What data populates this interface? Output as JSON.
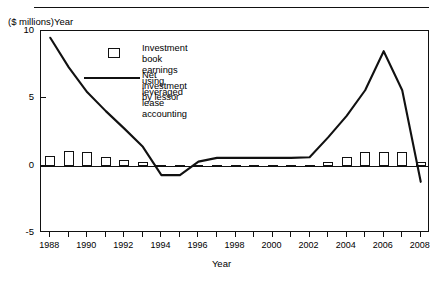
{
  "figure": {
    "y_axis_caption": "($ millions)Year",
    "x_title": "Year"
  },
  "legend": {
    "position": "inside-top-center",
    "items": [
      {
        "marker": "open-square",
        "label": "Investment book earnings using\nleveraged lease accounting"
      },
      {
        "marker": "solid-line",
        "label": "Net investment by lessor"
      }
    ]
  },
  "chart_data": {
    "type": "bar",
    "title": "",
    "subtitle": "",
    "xlabel": "Year",
    "ylabel": "($ millions)",
    "xlim": [
      1987.5,
      2008.5
    ],
    "ylim": [
      -5,
      10
    ],
    "yticks": [
      -5,
      0,
      5,
      10
    ],
    "ytick_labels": [
      "-5",
      "0",
      "5",
      "10"
    ],
    "xticks": [
      1988,
      1989,
      1990,
      1991,
      1992,
      1993,
      1994,
      1995,
      1996,
      1997,
      1998,
      1999,
      2000,
      2001,
      2002,
      2003,
      2004,
      2005,
      2006,
      2007,
      2008
    ],
    "xtick_labels": [
      "1988",
      "",
      "1990",
      "",
      "1992",
      "",
      "1994",
      "",
      "1996",
      "",
      "1998",
      "",
      "2000",
      "",
      "2002",
      "",
      "2004",
      "",
      "2006",
      "",
      "2008"
    ],
    "grid": false,
    "zero_line": true,
    "categories": [
      1988,
      1989,
      1990,
      1991,
      1992,
      1993,
      1994,
      1995,
      1996,
      1997,
      1998,
      1999,
      2000,
      2001,
      2002,
      2003,
      2004,
      2005,
      2006,
      2007,
      2008
    ],
    "series": [
      {
        "name": "Investment book earnings using leveraged lease accounting",
        "type": "bar",
        "color": "#111111",
        "fill": "#ffffff",
        "values": [
          0.72,
          1.12,
          1.02,
          0.62,
          0.42,
          0.26,
          0.07,
          0.07,
          0.07,
          0.07,
          0.07,
          0.07,
          0.07,
          0.07,
          0.07,
          0.3,
          0.62,
          1.0,
          1.0,
          1.0,
          0.26
        ]
      },
      {
        "name": "Net investment by lessor",
        "type": "line",
        "color": "#111111",
        "values": [
          9.5,
          7.3,
          5.45,
          4.05,
          2.75,
          1.4,
          -0.7,
          -0.7,
          0.3,
          0.58,
          0.58,
          0.58,
          0.58,
          0.58,
          0.62,
          2.1,
          3.7,
          5.6,
          8.5,
          5.6,
          -1.2
        ]
      }
    ]
  }
}
